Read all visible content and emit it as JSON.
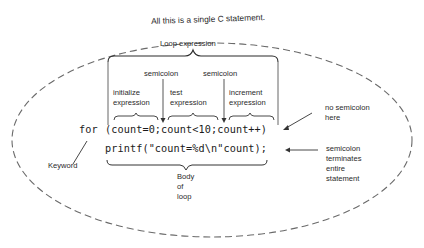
{
  "diagram": {
    "title": "All this is a single C statement.",
    "loop_expression_label": "Loop expression",
    "semicolon_label_1": "semicolon",
    "semicolon_label_2": "semicolon",
    "initialize_label_line1": "initialize",
    "initialize_label_line2": "expression",
    "test_label_line1": "test",
    "test_label_line2": "expression",
    "increment_label_line1": "increment",
    "increment_label_line2": "expression",
    "code": {
      "keyword": "for",
      "loop_header": "(count=0;count<10;count++)",
      "body": "printf(\"count=%d\\n\"count);"
    },
    "no_semicolon_line1": "no semicolon",
    "no_semicolon_line2": "here",
    "keyword_label": "Keyword",
    "body_label_line1": "Body",
    "body_label_line2": "of",
    "body_label_line3": "loop",
    "terminates_line1": "semicolon",
    "terminates_line2": "terminates",
    "terminates_line3": "entire",
    "terminates_line4": "statement"
  }
}
